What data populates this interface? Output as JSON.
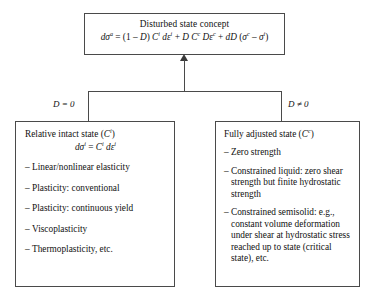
{
  "diagram": {
    "top_node": {
      "title": "Disturbed state concept",
      "equation_plain": "dσᵃ = (1 − D) Cⁱ dεⁱ + D Cᶜ Dεᶜ + dD (σᶜ − σⁱ)"
    },
    "branches": {
      "left_condition": "D = 0",
      "right_condition": "D ≠ 0"
    },
    "left_node": {
      "title_plain": "Relative intact state (Cⁱ)",
      "equation_plain": "dσⁱ = Cⁱ dεⁱ",
      "bullet_marker": "–",
      "items": [
        "Linear/nonlinear elasticity",
        "Plasticity: conventional",
        "Plasticity: continuous yield",
        "Viscoplasticity",
        "Thermoplasticity, etc."
      ]
    },
    "right_node": {
      "title_plain": "Fully adjusted state (Cᶜ)",
      "bullet_marker": "–",
      "items": [
        "Zero strength",
        "Constrained liquid: zero shear strength but finite hydrostatic strength",
        "Constrained semisolid: e.g., constant volume deformation under shear at hydrostatic stress reached up to state (critical state), etc."
      ]
    }
  },
  "colors": {
    "border": "#4a4a4a",
    "text": "#111111",
    "background": "#ffffff"
  }
}
